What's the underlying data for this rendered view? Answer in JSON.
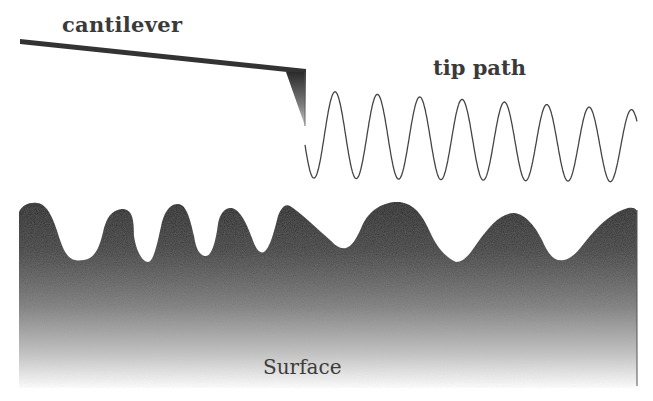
{
  "diagram": {
    "labels": {
      "cantilever": "cantilever",
      "tip_path": "tip path",
      "surface": "Surface"
    },
    "colors": {
      "cantilever": "#333333",
      "tip_dark": "#2a2a2a",
      "tip_light": "#bdbdbd",
      "tip_path_stroke": "#444444",
      "surface_top": "#1e1e1e",
      "surface_bottom": "#ffffff",
      "label_text": "#3a3a3a"
    },
    "elements": [
      {
        "name": "cantilever",
        "shape": "thick line",
        "from": [
          20,
          41
        ],
        "to": [
          305,
          72
        ]
      },
      {
        "name": "tip",
        "shape": "triangle",
        "points": [
          [
            286,
            70
          ],
          [
            306,
            70
          ],
          [
            304,
            126
          ]
        ]
      },
      {
        "name": "tip-path",
        "shape": "sine wave",
        "x_range": [
          305,
          637
        ],
        "periods": 8
      },
      {
        "name": "surface",
        "shape": "gradient-filled wavy profile",
        "x_range": [
          19,
          637
        ]
      }
    ]
  }
}
